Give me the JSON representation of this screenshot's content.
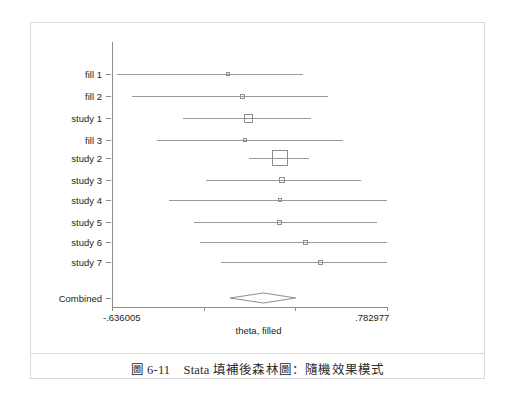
{
  "figure": {
    "caption": "圖 6-11　Stata 填補後森林圖：隨機效果模式"
  },
  "chart_data": {
    "type": "forest",
    "title": "",
    "xlabel": "theta, filled",
    "ylabel": "",
    "xlim": [
      -0.636005,
      0.782977
    ],
    "xticks": [
      -0.636005,
      -0.163011,
      0.309983,
      0.782977
    ],
    "xtick_labels": [
      "-.636005",
      "",
      "",
      ".782977"
    ],
    "grid": false,
    "legend": null,
    "axis_tick_labels_shown": [
      "-.636005",
      ".782977"
    ],
    "categories": [
      "fill 1",
      "fill 2",
      "study 1",
      "fill 3",
      "study 2",
      "study 3",
      "study 4",
      "study 5",
      "study 6",
      "study 7"
    ],
    "studies": [
      {
        "label": "fill 1",
        "effect": -0.039,
        "ci_low": -0.61,
        "ci_high": 0.35,
        "weight_box": 4
      },
      {
        "label": "fill 2",
        "effect": 0.039,
        "ci_low": -0.532,
        "ci_high": 0.479,
        "weight_box": 5
      },
      {
        "label": "study 1",
        "effect": 0.07,
        "ci_low": -0.272,
        "ci_high": 0.39,
        "weight_box": 9
      },
      {
        "label": "fill 3",
        "effect": 0.052,
        "ci_low": -0.402,
        "ci_high": 0.558,
        "weight_box": 4
      },
      {
        "label": "study 2",
        "effect": 0.23,
        "ci_low": 0.07,
        "ci_high": 0.38,
        "weight_box": 16
      },
      {
        "label": "study 3",
        "effect": 0.243,
        "ci_low": -0.153,
        "ci_high": 0.65,
        "weight_box": 6
      },
      {
        "label": "study 4",
        "effect": 0.23,
        "ci_low": -0.34,
        "ci_high": 0.782,
        "weight_box": 4
      },
      {
        "label": "study 5",
        "effect": 0.23,
        "ci_low": -0.211,
        "ci_high": 0.73,
        "weight_box": 5
      },
      {
        "label": "study 6",
        "effect": 0.363,
        "ci_low": -0.184,
        "ci_high": 0.782,
        "weight_box": 5
      },
      {
        "label": "study 7",
        "effect": 0.441,
        "ci_low": -0.074,
        "ci_high": 0.782,
        "weight_box": 5
      }
    ],
    "combined": {
      "label": "Combined",
      "effect": 0.144,
      "ci_low": -0.029,
      "ci_high": 0.31,
      "shape": "diamond"
    }
  }
}
